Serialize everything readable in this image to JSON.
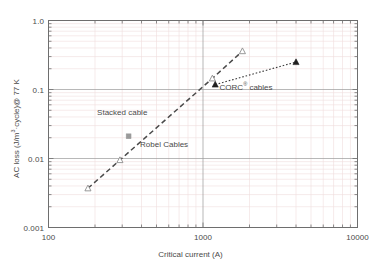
{
  "chart_data": {
    "type": "scatter",
    "title": "",
    "xlabel": "Critical current (A)",
    "ylabel": "AC loss (J/m³·cycle)@ 77 K",
    "ylabel_main": "AC loss (J/m",
    "ylabel_sup": "3",
    "ylabel_tail": "·cycle)@ 77 K",
    "xscale": "log",
    "yscale": "log",
    "xlim": [
      100,
      10000
    ],
    "ylim": [
      0.001,
      1.0
    ],
    "grid": true,
    "minor_grid": true,
    "legend": "annotations",
    "xticks": [
      100,
      1000,
      10000
    ],
    "xticklabels": [
      "100",
      "1000",
      "10000"
    ],
    "yticks": [
      0.001,
      0.01,
      0.1,
      1.0
    ],
    "yticklabels": [
      "0.001",
      "0.01",
      "0.1",
      "1.0"
    ],
    "series": [
      {
        "name": "Robel Cables",
        "marker": "triangle-open",
        "marker_color": "#8d8d8d",
        "line_style": "dashed",
        "line_color": "#4a4a4a",
        "x": [
          180,
          290,
          1150,
          1800
        ],
        "y": [
          0.0037,
          0.0095,
          0.145,
          0.36
        ]
      },
      {
        "name": "CORC® cables",
        "marker": "triangle-filled",
        "marker_color": "#1f1f1f",
        "line_style": "dotted",
        "line_color": "#3a3a3a",
        "x": [
          1200,
          4000
        ],
        "y": [
          0.118,
          0.25
        ]
      },
      {
        "name": "Stacked cable",
        "marker": "square",
        "marker_color": "#9a9a9a",
        "line_style": "none",
        "x": [
          330
        ],
        "y": [
          0.021
        ]
      }
    ],
    "annotations": [
      {
        "text": "Stacked cable",
        "x": 300,
        "y": 0.046
      },
      {
        "text": "Robel Cables",
        "x": 560,
        "y": 0.0155
      },
      {
        "text": "CORC® cables",
        "x": 1900,
        "y": 0.105,
        "has_superscript": true,
        "text_main": "CORC",
        "text_sup": "®",
        "text_tail": " cables"
      }
    ]
  }
}
